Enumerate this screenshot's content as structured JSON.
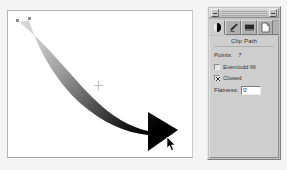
{
  "window": {
    "palette_title": "",
    "collapse_button_name": "collapse-button",
    "close_button_name": "close-button"
  },
  "palette": {
    "tabs": [
      {
        "name": "tab-gradient",
        "icon": "gradient-circle-icon",
        "active": true,
        "label": ""
      },
      {
        "name": "tab-pen",
        "icon": "pen-nib-icon",
        "active": false,
        "label": ""
      },
      {
        "name": "tab-swatch",
        "icon": "filled-rect-icon",
        "active": false,
        "label": ""
      },
      {
        "name": "tab-page",
        "icon": "page-icon",
        "active": false,
        "label": ""
      }
    ],
    "title": "Clip Path",
    "points": {
      "label": "Points:",
      "value": "7"
    },
    "checkboxes": [
      {
        "name": "even-odd-fill-checkbox",
        "label": "Even/odd fill",
        "checked": false
      },
      {
        "name": "closed-checkbox",
        "label": "Closed",
        "checked": true
      }
    ],
    "flatness": {
      "label": "Flatness:",
      "value": "0",
      "placeholder": "0"
    }
  },
  "canvas": {
    "background": "#ffffff",
    "artwork_name": "curved-gradient-arrow",
    "gradient_start": "#d9d9d9",
    "gradient_end": "#000000",
    "anchor_point_color": "#909090",
    "center_marker_name": "center-origin-marker",
    "cursor_name": "mouse-pointer"
  },
  "colors": {
    "app_background": "#f4f4f4",
    "palette_face": "#c3c3c3",
    "panel_face": "#cecece",
    "text": "#333333",
    "field_white": "#ffffff"
  }
}
